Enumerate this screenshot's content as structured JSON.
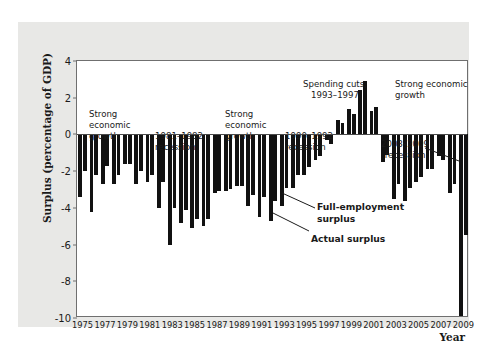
{
  "chart_data": {
    "type": "bar",
    "title": "",
    "xlabel": "Year",
    "ylabel": "Surplus (percentage of GDP)",
    "ylim": [
      -10,
      4
    ],
    "yticks": [
      4,
      2,
      0,
      -2,
      -4,
      -6,
      -8,
      -10
    ],
    "ytick_labels": [
      "4",
      "2",
      "0",
      "-2",
      "-4",
      "-6",
      "-8",
      "-10"
    ],
    "grid": false,
    "legend_position": "inline-annotations",
    "x": [
      1975,
      1976,
      1977,
      1978,
      1979,
      1980,
      1981,
      1982,
      1983,
      1984,
      1985,
      1986,
      1987,
      1988,
      1989,
      1990,
      1991,
      1992,
      1993,
      1994,
      1995,
      1996,
      1997,
      1998,
      1999,
      2000,
      2001,
      2002,
      2003,
      2004,
      2005,
      2006,
      2007,
      2008,
      2009
    ],
    "xtick_labels": [
      "1975",
      "1977",
      "1979",
      "1981",
      "1983",
      "1985",
      "1987",
      "1989",
      "1991",
      "1993",
      "1995",
      "1997",
      "1999",
      "2001",
      "2003",
      "2005",
      "2007",
      "2009"
    ],
    "series": [
      {
        "name": "Actual surplus",
        "values": [
          -3.4,
          -4.2,
          -2.7,
          -2.7,
          -1.6,
          -2.7,
          -2.6,
          -4.0,
          -6.0,
          -4.8,
          -5.1,
          -5.0,
          -3.2,
          -3.1,
          -2.8,
          -3.9,
          -4.5,
          -4.7,
          -3.9,
          -2.9,
          -2.2,
          -1.4,
          -0.3,
          0.8,
          1.4,
          2.4,
          1.3,
          -1.5,
          -3.5,
          -3.6,
          -2.6,
          -1.9,
          -1.2,
          -3.2,
          -9.9
        ]
      },
      {
        "name": "Full-employment surplus",
        "values": [
          -2.0,
          -2.2,
          -1.7,
          -2.2,
          -1.6,
          -2.0,
          -2.2,
          -2.6,
          -4.0,
          -4.1,
          -4.6,
          -4.6,
          -3.1,
          -3.0,
          -2.8,
          -3.3,
          -3.4,
          -3.6,
          -2.9,
          -2.2,
          -1.8,
          -1.2,
          -0.5,
          0.6,
          1.1,
          2.9,
          1.5,
          -1.1,
          -2.7,
          -2.9,
          -2.3,
          -1.9,
          -1.4,
          -2.7,
          -5.5
        ]
      }
    ],
    "annotations": [
      {
        "id": "strong-growth-1",
        "text": "Strong\neconomic\ngrowth",
        "bold": false
      },
      {
        "id": "recession-1981",
        "text": "1981–1982\nrecession",
        "bold": false
      },
      {
        "id": "strong-growth-2",
        "text": "Strong\neconomic\ngrowth",
        "bold": false
      },
      {
        "id": "recession-1990",
        "text": "1990–1992\nrecession",
        "bold": false
      },
      {
        "id": "spending-cuts",
        "text": "Spending cuts,\n1993–1997",
        "bold": false
      },
      {
        "id": "strong-growth-3",
        "text": "Strong economic\ngrowth",
        "bold": false
      },
      {
        "id": "recession-2008",
        "text": "2008–2009\nrecession",
        "bold": false
      },
      {
        "id": "full-employment-surplus",
        "text": "Full-employment\nsurplus",
        "bold": true
      },
      {
        "id": "actual-surplus",
        "text": "Actual surplus",
        "bold": true
      }
    ],
    "colors": {
      "bar": "#111111",
      "axis": "#6f6f6f",
      "panel_background": "#e8e8e6",
      "plot_background": "#ffffff",
      "text": "#1a1a1a"
    }
  }
}
